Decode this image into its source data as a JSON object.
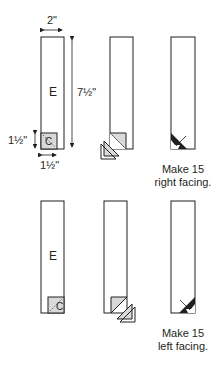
{
  "diagram": {
    "row1": {
      "unit_label": "E",
      "corner_label": "C",
      "dim_width": "2\"",
      "dim_height": "7½\"",
      "dim_square_height": "1½\"",
      "dim_square_width": "1½\"",
      "caption_line1": "Make 15",
      "caption_line2": "right facing."
    },
    "row2": {
      "unit_label": "E",
      "corner_label": "C",
      "caption_line1": "Make 15",
      "caption_line2": "left facing."
    },
    "colors": {
      "line": "#231f20",
      "fabric_gray": "#d9d9d9",
      "dark_triangle": "#231f20"
    }
  }
}
